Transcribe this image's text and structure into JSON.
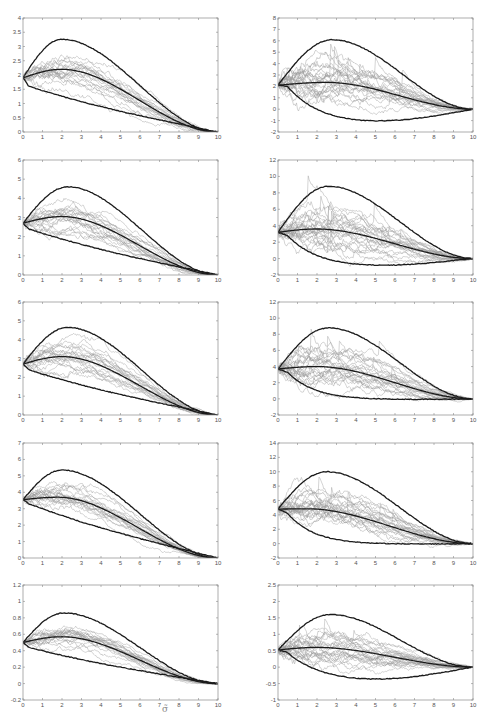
{
  "caption": "σ̃",
  "colors": {
    "frame": "#8a8a8a",
    "tick_text": "#555555",
    "paths": "#9a9a9a",
    "bold": "#1a1a1a"
  },
  "chart_data": [
    {
      "type": "line",
      "id": "r1c1",
      "row": 1,
      "col": 1,
      "xlim": [
        0,
        10
      ],
      "ylim": [
        0,
        4
      ],
      "xticks": [
        0,
        1,
        2,
        3,
        4,
        5,
        6,
        7,
        8,
        9,
        10
      ],
      "yticks": [
        "0",
        "0.5",
        "1",
        "1.5",
        "2",
        "2.5",
        "3",
        "3.5",
        "4"
      ],
      "ytick_values": [
        0,
        0.5,
        1,
        1.5,
        2,
        2.5,
        3,
        3.5,
        4
      ],
      "start": 1.9,
      "mean_peak": 2.2,
      "mean_peak_x": 2,
      "upper_peak": 3.25,
      "upper_peak_x": 2,
      "lower_start": 1.6,
      "lower_min": 0.0,
      "lower_shape": "decreasing",
      "paths": 20,
      "path_max": 3.75,
      "grid": false,
      "legend": "none"
    },
    {
      "type": "line",
      "id": "r1c2",
      "row": 1,
      "col": 2,
      "xlim": [
        0,
        10
      ],
      "ylim": [
        -2,
        8
      ],
      "xticks": [
        0,
        1,
        2,
        3,
        4,
        5,
        6,
        7,
        8,
        9,
        10
      ],
      "yticks": [
        "-2",
        "-1",
        "0",
        "1",
        "2",
        "3",
        "4",
        "5",
        "6",
        "7",
        "8"
      ],
      "ytick_values": [
        -2,
        -1,
        0,
        1,
        2,
        3,
        4,
        5,
        6,
        7,
        8
      ],
      "start": 2.1,
      "mean_peak": 2.35,
      "mean_peak_x": 2.5,
      "upper_peak": 6.1,
      "upper_peak_x": 2.8,
      "lower_start": 2.0,
      "lower_min": -1.1,
      "lower_shape": "dip",
      "paths": 25,
      "path_max": 6.0,
      "grid": false,
      "legend": "none"
    },
    {
      "type": "line",
      "id": "r2c1",
      "row": 2,
      "col": 1,
      "xlim": [
        0,
        10
      ],
      "ylim": [
        0,
        6
      ],
      "xticks": [
        0,
        1,
        2,
        3,
        4,
        5,
        6,
        7,
        8,
        9,
        10
      ],
      "yticks": [
        "0",
        "1",
        "2",
        "3",
        "4",
        "5",
        "6"
      ],
      "ytick_values": [
        0,
        1,
        2,
        3,
        4,
        5,
        6
      ],
      "start": 2.7,
      "mean_peak": 3.05,
      "mean_peak_x": 2,
      "upper_peak": 4.6,
      "upper_peak_x": 2.3,
      "lower_start": 2.4,
      "lower_min": 0.0,
      "lower_shape": "decreasing",
      "paths": 20,
      "path_max": 5.3,
      "grid": false,
      "legend": "none"
    },
    {
      "type": "line",
      "id": "r2c2",
      "row": 2,
      "col": 2,
      "xlim": [
        0,
        10
      ],
      "ylim": [
        -2,
        12
      ],
      "xticks": [
        0,
        1,
        2,
        3,
        4,
        5,
        6,
        7,
        8,
        9,
        10
      ],
      "yticks": [
        "-2",
        "0",
        "2",
        "4",
        "6",
        "8",
        "10",
        "12"
      ],
      "ytick_values": [
        -2,
        0,
        2,
        4,
        6,
        8,
        10,
        12
      ],
      "start": 3.2,
      "mean_peak": 3.6,
      "mean_peak_x": 2,
      "upper_peak": 8.8,
      "upper_peak_x": 2.6,
      "lower_start": 2.8,
      "lower_min": -0.9,
      "lower_shape": "dip",
      "paths": 25,
      "path_max": 8.8,
      "grid": false,
      "legend": "none"
    },
    {
      "type": "line",
      "id": "r3c1",
      "row": 3,
      "col": 1,
      "xlim": [
        0,
        10
      ],
      "ylim": [
        0,
        6
      ],
      "xticks": [
        0,
        1,
        2,
        3,
        4,
        5,
        6,
        7,
        8,
        9,
        10
      ],
      "yticks": [
        "0",
        "1",
        "2",
        "3",
        "4",
        "5",
        "6"
      ],
      "ytick_values": [
        0,
        1,
        2,
        3,
        4,
        5,
        6
      ],
      "start": 2.7,
      "mean_peak": 3.1,
      "mean_peak_x": 2,
      "upper_peak": 4.65,
      "upper_peak_x": 2.3,
      "lower_start": 2.4,
      "lower_min": 0.0,
      "lower_shape": "decreasing",
      "paths": 20,
      "path_max": 5.3,
      "grid": false,
      "legend": "none"
    },
    {
      "type": "line",
      "id": "r3c2",
      "row": 3,
      "col": 2,
      "xlim": [
        0,
        10
      ],
      "ylim": [
        -2,
        12
      ],
      "xticks": [
        0,
        1,
        2,
        3,
        4,
        5,
        6,
        7,
        8,
        9,
        10
      ],
      "yticks": [
        "-2",
        "0",
        "2",
        "4",
        "6",
        "8",
        "10",
        "12"
      ],
      "ytick_values": [
        -2,
        0,
        2,
        4,
        6,
        8,
        10,
        12
      ],
      "start": 3.7,
      "mean_peak": 4.0,
      "mean_peak_x": 2,
      "upper_peak": 8.8,
      "upper_peak_x": 2.6,
      "lower_start": 3.3,
      "lower_min": -0.1,
      "lower_shape": "dip",
      "paths": 25,
      "path_max": 8.8,
      "grid": false,
      "legend": "none"
    },
    {
      "type": "line",
      "id": "r4c1",
      "row": 4,
      "col": 1,
      "xlim": [
        0,
        10
      ],
      "ylim": [
        0,
        7
      ],
      "xticks": [
        0,
        1,
        2,
        3,
        4,
        5,
        6,
        7,
        8,
        9,
        10
      ],
      "yticks": [
        "0",
        "1",
        "2",
        "3",
        "4",
        "5",
        "6",
        "7"
      ],
      "ytick_values": [
        0,
        1,
        2,
        3,
        4,
        5,
        6,
        7
      ],
      "start": 3.55,
      "mean_peak": 3.7,
      "mean_peak_x": 1.8,
      "upper_peak": 5.35,
      "upper_peak_x": 2,
      "lower_start": 3.3,
      "lower_min": 0.0,
      "lower_shape": "decreasing",
      "paths": 20,
      "path_max": 6.3,
      "grid": false,
      "legend": "none"
    },
    {
      "type": "line",
      "id": "r4c2",
      "row": 4,
      "col": 2,
      "xlim": [
        0,
        10
      ],
      "ylim": [
        -2,
        14
      ],
      "xticks": [
        0,
        1,
        2,
        3,
        4,
        5,
        6,
        7,
        8,
        9,
        10
      ],
      "yticks": [
        "-2",
        "0",
        "2",
        "4",
        "6",
        "8",
        "10",
        "12",
        "14"
      ],
      "ytick_values": [
        -2,
        0,
        2,
        4,
        6,
        8,
        10,
        12,
        14
      ],
      "start": 4.8,
      "mean_peak": 4.85,
      "mean_peak_x": 1.5,
      "upper_peak": 10.0,
      "upper_peak_x": 2.5,
      "lower_start": 4.2,
      "lower_min": -0.1,
      "lower_shape": "dip",
      "paths": 25,
      "path_max": 9.8,
      "grid": false,
      "legend": "none"
    },
    {
      "type": "line",
      "id": "r5c1",
      "row": 5,
      "col": 1,
      "xlim": [
        0,
        10
      ],
      "ylim": [
        -0.2,
        1.2
      ],
      "xticks": [
        0,
        1,
        2,
        3,
        4,
        5,
        6,
        7,
        8,
        9,
        10
      ],
      "yticks": [
        "-0.2",
        "0",
        "0.2",
        "0.4",
        "0.6",
        "0.8",
        "1",
        "1.2"
      ],
      "ytick_values": [
        -0.2,
        0,
        0.2,
        0.4,
        0.6,
        0.8,
        1,
        1.2
      ],
      "start": 0.5,
      "mean_peak": 0.57,
      "mean_peak_x": 2,
      "upper_peak": 0.86,
      "upper_peak_x": 2.1,
      "lower_start": 0.44,
      "lower_min": 0.0,
      "lower_shape": "decreasing",
      "paths": 20,
      "path_max": 1.0,
      "grid": false,
      "legend": "none"
    },
    {
      "type": "line",
      "id": "r5c2",
      "row": 5,
      "col": 2,
      "xlim": [
        0,
        10
      ],
      "ylim": [
        -1,
        2.5
      ],
      "xticks": [
        0,
        1,
        2,
        3,
        4,
        5,
        6,
        7,
        8,
        9,
        10
      ],
      "yticks": [
        "-1",
        "-0.5",
        "0",
        "0.5",
        "1",
        "1.5",
        "2",
        "2.5"
      ],
      "ytick_values": [
        -1,
        -0.5,
        0,
        0.5,
        1,
        1.5,
        2,
        2.5
      ],
      "start": 0.52,
      "mean_peak": 0.6,
      "mean_peak_x": 2,
      "upper_peak": 1.6,
      "upper_peak_x": 2.7,
      "lower_start": 0.45,
      "lower_min": -0.38,
      "lower_shape": "dip",
      "paths": 25,
      "path_max": 1.6,
      "grid": false,
      "legend": "none"
    }
  ],
  "layout": {
    "col_x": [
      23,
      278
    ],
    "plot_width": 195,
    "rows": [
      {
        "top": 18,
        "height": 114
      },
      {
        "top": 160,
        "height": 115
      },
      {
        "top": 302,
        "height": 113
      },
      {
        "top": 443,
        "height": 115
      },
      {
        "top": 585,
        "height": 115
      }
    ]
  }
}
